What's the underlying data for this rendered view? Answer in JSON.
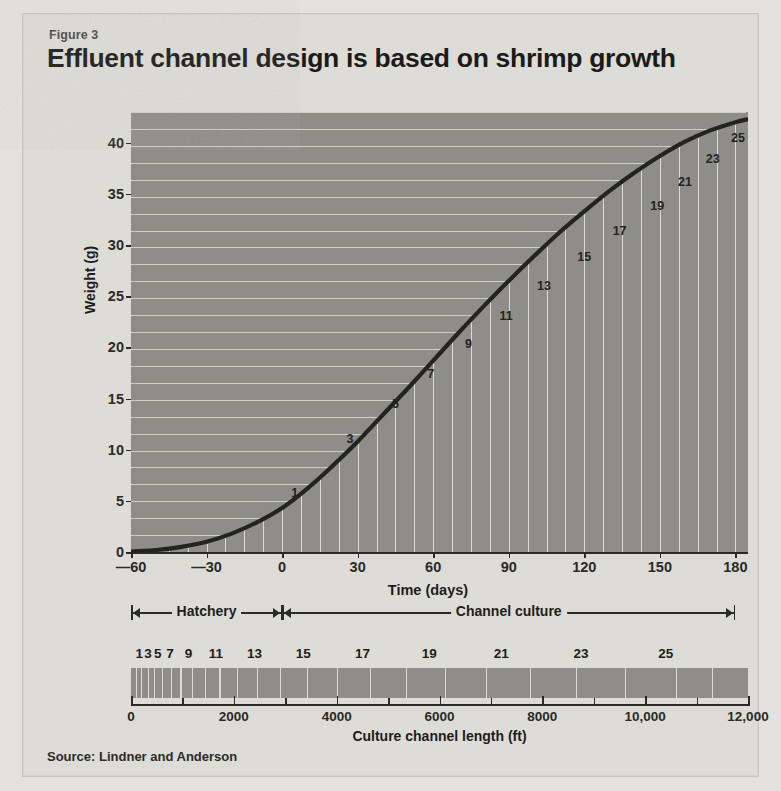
{
  "figure": {
    "label": "Figure 3",
    "title": "Effluent channel design is based on shrimp growth",
    "source": "Source: Lindner and Anderson"
  },
  "chart_data": {
    "type": "line",
    "title": "Effluent channel design is based on shrimp growth",
    "xlabel": "Time (days)",
    "ylabel": "Weight (g)",
    "xlim": [
      -60,
      185
    ],
    "ylim": [
      0,
      43
    ],
    "xticks": [
      -60,
      -30,
      0,
      30,
      60,
      90,
      120,
      150,
      180
    ],
    "xtick_labels": [
      "—60",
      "—30",
      "0",
      "30",
      "60",
      "90",
      "120",
      "150",
      "180"
    ],
    "yticks": [
      0,
      5,
      10,
      15,
      20,
      25,
      30,
      35,
      40
    ],
    "ytick_labels": [
      "0",
      "5",
      "10",
      "15",
      "20",
      "25",
      "30",
      "35",
      "40"
    ],
    "grid": true,
    "legend": null,
    "series": [
      {
        "name": "Shrimp growth",
        "x": [
          -60,
          -50,
          -40,
          -30,
          -20,
          -10,
          0,
          10,
          20,
          30,
          40,
          50,
          60,
          70,
          80,
          90,
          100,
          110,
          120,
          130,
          140,
          150,
          160,
          170,
          180,
          185
        ],
        "y": [
          0.05,
          0.2,
          0.5,
          1.0,
          1.8,
          2.9,
          4.3,
          6.2,
          8.4,
          10.8,
          13.4,
          16.0,
          18.7,
          21.4,
          24.0,
          26.5,
          28.9,
          31.2,
          33.3,
          35.3,
          37.1,
          38.7,
          40.1,
          41.2,
          42.0,
          42.3
        ]
      }
    ],
    "point_labels": [
      {
        "label": "1",
        "x": 5,
        "y": 5.8
      },
      {
        "label": "3",
        "x": 27,
        "y": 11.0
      },
      {
        "label": "5",
        "x": 45,
        "y": 14.5
      },
      {
        "label": "7",
        "x": 59,
        "y": 17.4
      },
      {
        "label": "9",
        "x": 74,
        "y": 20.3
      },
      {
        "label": "11",
        "x": 89,
        "y": 23.1
      },
      {
        "label": "13",
        "x": 104,
        "y": 26.0
      },
      {
        "label": "15",
        "x": 120,
        "y": 28.8
      },
      {
        "label": "17",
        "x": 134,
        "y": 31.4
      },
      {
        "label": "19",
        "x": 149,
        "y": 33.8
      },
      {
        "label": "21",
        "x": 160,
        "y": 36.2
      },
      {
        "label": "23",
        "x": 171,
        "y": 38.4
      },
      {
        "label": "25",
        "x": 181,
        "y": 40.5
      }
    ]
  },
  "phases": [
    {
      "name": "Hatchery",
      "start": -60,
      "end": 0
    },
    {
      "name": "Channel culture",
      "start": 0,
      "end": 180
    }
  ],
  "channel_strip": {
    "title": "Culture channel length (ft)",
    "xlim": [
      0,
      12000
    ],
    "tick_labels": [
      "0",
      "2000",
      "4000",
      "6000",
      "8000",
      "10,000",
      "12,000"
    ],
    "tick_values": [
      0,
      2000,
      4000,
      6000,
      8000,
      10000,
      12000
    ],
    "minor_ticks": [
      1000,
      3000,
      5000,
      7000,
      9000,
      11000
    ],
    "section_numbers": [
      "1",
      "3",
      "5",
      "7",
      "9",
      "11",
      "13",
      "15",
      "17",
      "19",
      "21",
      "23",
      "25"
    ],
    "section_number_positions": [
      160,
      330,
      520,
      760,
      1120,
      1650,
      2400,
      3350,
      4500,
      5800,
      7200,
      8750,
      10400
    ],
    "segment_boundaries": [
      0,
      90,
      200,
      320,
      450,
      600,
      770,
      960,
      1180,
      1430,
      1720,
      2060,
      2450,
      2900,
      3420,
      4000,
      4650,
      5350,
      6100,
      6900,
      7750,
      8650,
      9600,
      10600,
      11300,
      12000
    ]
  },
  "colors": {
    "page_background": "#e3e2de",
    "card_background": "#dedcd6",
    "plot_fill": "#8e8d88",
    "gridline": "#dbdad4",
    "curve": "#232320",
    "text": "#1d1d1b"
  }
}
